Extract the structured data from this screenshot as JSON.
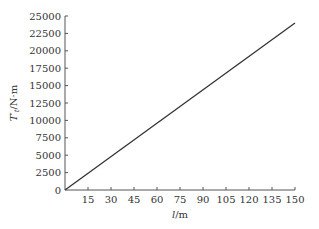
{
  "chart_data": {
    "type": "line",
    "title": "",
    "xlabel": "l/m",
    "ylabel": "T′t/N·m",
    "ylabel_parts": {
      "base": "T",
      "prime": "′",
      "sub": "t",
      "unit": "/N·m"
    },
    "xlim": [
      0,
      150
    ],
    "ylim": [
      0,
      25000
    ],
    "x_ticks": [
      15,
      30,
      45,
      60,
      75,
      90,
      105,
      120,
      135,
      150
    ],
    "x_tick_labels": [
      "15",
      "30",
      "45",
      "60",
      "75",
      "90",
      "105",
      "120",
      "135",
      "150"
    ],
    "y_ticks": [
      0,
      2500,
      5000,
      7500,
      10000,
      12500,
      15000,
      17500,
      20000,
      22500,
      25000
    ],
    "y_tick_labels": [
      "0",
      "2500",
      "5000",
      "7500",
      "10000",
      "12500",
      "15000",
      "17500",
      "20000",
      "22500",
      "25000"
    ],
    "origin_label": "0",
    "grid": false,
    "legend": null,
    "series": [
      {
        "name": "T′t",
        "x": [
          0,
          150
        ],
        "y": [
          0,
          24000
        ],
        "color": "#333333"
      }
    ]
  }
}
